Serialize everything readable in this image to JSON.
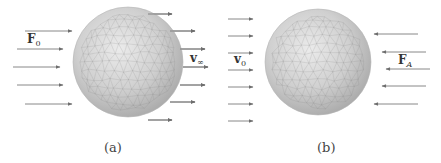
{
  "panels": [
    {
      "id": "a",
      "caption": "(a)",
      "force_label": {
        "main": "F",
        "sub": "0"
      },
      "velocity_label": {
        "main": "v",
        "sub": "∞"
      },
      "sphere": {
        "cx": 128,
        "cy": 62,
        "r": 55
      },
      "incoming_arrows": [
        {
          "y": 31,
          "x1": 25,
          "x2": 72
        },
        {
          "y": 49,
          "x1": 17,
          "x2": 63
        },
        {
          "y": 67,
          "x1": 13,
          "x2": 60
        },
        {
          "y": 85,
          "x1": 17,
          "x2": 63
        },
        {
          "y": 104,
          "x1": 25,
          "x2": 72
        }
      ],
      "outgoing_arrows": [
        {
          "y": 14,
          "x1": 148,
          "x2": 172
        },
        {
          "y": 31,
          "x1": 170,
          "x2": 195
        },
        {
          "y": 49,
          "x1": 180,
          "x2": 205
        },
        {
          "y": 67,
          "x1": 183,
          "x2": 208
        },
        {
          "y": 85,
          "x1": 180,
          "x2": 205
        },
        {
          "y": 102,
          "x1": 170,
          "x2": 195
        },
        {
          "y": 120,
          "x1": 148,
          "x2": 172
        }
      ]
    },
    {
      "id": "b",
      "caption": "(b)",
      "velocity_label": {
        "main": "v",
        "sub": "0"
      },
      "force_label": {
        "main": "F",
        "sub": "A"
      },
      "sphere": {
        "cx": 318,
        "cy": 62,
        "r": 53
      },
      "incoming_arrows": [
        {
          "y": 19,
          "x1": 228,
          "x2": 253
        },
        {
          "y": 36,
          "x1": 228,
          "x2": 253
        },
        {
          "y": 53,
          "x1": 228,
          "x2": 253
        },
        {
          "y": 70,
          "x1": 228,
          "x2": 253
        },
        {
          "y": 87,
          "x1": 228,
          "x2": 253
        },
        {
          "y": 104,
          "x1": 228,
          "x2": 253
        },
        {
          "y": 121,
          "x1": 228,
          "x2": 253
        }
      ],
      "opposing_arrows": [
        {
          "y": 34,
          "x1": 418,
          "x2": 374
        },
        {
          "y": 52,
          "x1": 426,
          "x2": 382
        },
        {
          "y": 69,
          "x1": 430,
          "x2": 386
        },
        {
          "y": 86,
          "x1": 426,
          "x2": 382
        },
        {
          "y": 104,
          "x1": 418,
          "x2": 374
        }
      ]
    }
  ],
  "colors": {
    "arrow": "#7a7a7a",
    "sphere_light": "#e6e6e6",
    "sphere_mid": "#c4c4c4",
    "sphere_dark": "#9a9a9a",
    "mesh": "#8c8c8c"
  }
}
